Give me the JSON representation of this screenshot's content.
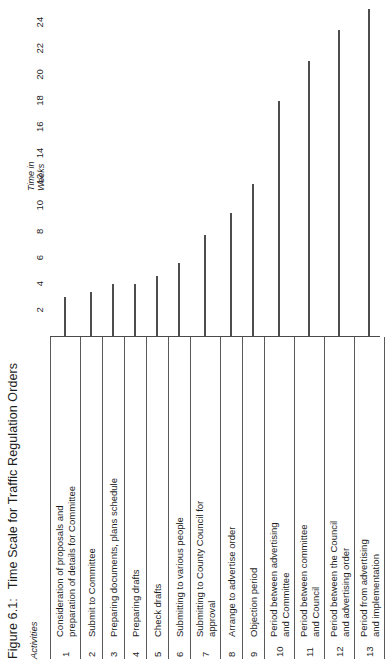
{
  "figure": {
    "number": "Figure 6.1:",
    "title": "Time Scale for Traffic Regulation Orders"
  },
  "chart_data": {
    "type": "bar",
    "orientation": "horizontal",
    "title": "Time Scale for Traffic Regulation Orders",
    "xlabel": "Time in Weeks",
    "ylabel": "Activities",
    "xlim": [
      0,
      25
    ],
    "grid": false,
    "legend": null,
    "axis_title_lines": [
      "Time in",
      "Weeks"
    ],
    "column_header": "Activities",
    "tick_labels": [
      "2",
      "4",
      "6",
      "8",
      "10",
      "12",
      "14",
      "16",
      "18",
      "20",
      "22",
      "24"
    ],
    "tick_values": [
      2,
      4,
      6,
      8,
      10,
      12,
      14,
      16,
      18,
      20,
      22,
      24
    ],
    "categories": [
      "Consideration of proposals and\npreparation of details for Committee",
      "Submit to Committee",
      "Preparing documents, plans schedule",
      "Preparing drafts",
      "Check drafts",
      "Submitting to various people",
      "Submitting to County Council for\napproval",
      "Arrange to advertise order",
      "Objection period",
      "Period between advertising\nand Committee",
      "Period between committee\nand Council",
      "Period between the Council\nand advertising order",
      "Period from advertising\nand implementation"
    ],
    "row_numbers": [
      "1",
      "2",
      "3",
      "4",
      "5",
      "6",
      "7",
      "8",
      "9",
      "10",
      "11",
      "12",
      "13"
    ],
    "values": [
      3.0,
      3.4,
      4.0,
      4.0,
      4.6,
      5.6,
      7.7,
      9.4,
      11.6,
      18.0,
      21.0,
      23.4,
      25.0
    ]
  }
}
